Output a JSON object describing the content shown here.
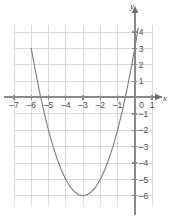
{
  "chart_data": {
    "type": "line",
    "title": "",
    "subtitle": "",
    "xlabel": "x",
    "ylabel": "y",
    "xlim": [
      -7,
      1
    ],
    "ylim": [
      -6.6,
      4.4
    ],
    "grid": true,
    "legend": null,
    "equation": "y = x^2 + 6x + 3",
    "vertex": [
      -3,
      -6
    ],
    "y_intercept": 3,
    "x_intercepts": [
      -5.449,
      -0.551
    ],
    "xticks": [
      -7,
      -6,
      -5,
      -4,
      -3,
      -2,
      -1,
      0,
      1
    ],
    "yticks": [
      4,
      3,
      2,
      1,
      -1,
      -2,
      -3,
      -4,
      -5,
      -6
    ],
    "xtick_labels": [
      "–7",
      "–6",
      "–5",
      "–4",
      "–3",
      "–2",
      "–1",
      "0",
      "1"
    ],
    "ytick_labels": [
      "4",
      "3",
      "2",
      "1",
      "–1",
      "–2",
      "–3",
      "–4",
      "–5",
      "–6"
    ],
    "series": [
      {
        "name": "parabola",
        "color": "#7d7d7d",
        "x": [
          -6.0,
          -5.75,
          -5.5,
          -5.25,
          -5.0,
          -4.75,
          -4.5,
          -4.25,
          -4.0,
          -3.75,
          -3.5,
          -3.25,
          -3.0,
          -2.75,
          -2.5,
          -2.25,
          -2.0,
          -1.75,
          -1.5,
          -1.25,
          -1.0,
          -0.75,
          -0.5,
          -0.25,
          0.0,
          0.2
        ],
        "y": [
          3.0,
          1.5625,
          0.25,
          -0.9375,
          -2.0,
          -2.9375,
          -3.75,
          -4.4375,
          -5.0,
          -5.4375,
          -5.75,
          -5.9375,
          -6.0,
          -5.9375,
          -5.75,
          -5.4375,
          -5.0,
          -4.4375,
          -3.75,
          -2.9375,
          -2.0,
          -0.9375,
          0.25,
          1.5625,
          3.0,
          4.24
        ]
      }
    ]
  },
  "axes": {
    "x_axis_name": "x",
    "y_axis_name": "y"
  }
}
